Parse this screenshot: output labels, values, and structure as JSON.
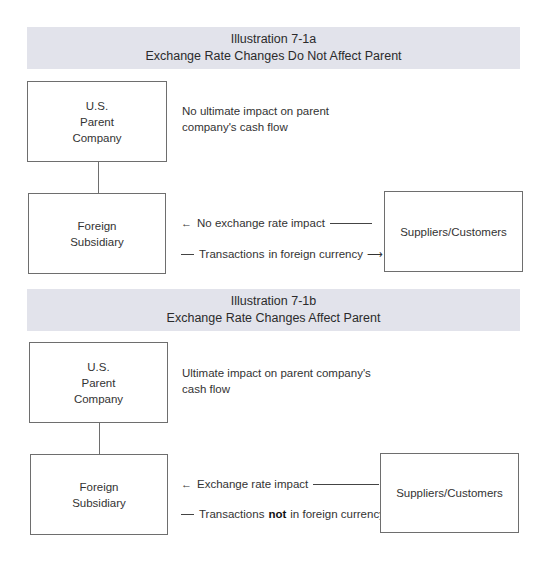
{
  "panels": [
    {
      "header": {
        "title": "Illustration 7-1a",
        "subtitle": "Exchange Rate Changes Do Not Affect Parent"
      },
      "parent_box": {
        "line1": "U.S.",
        "line2": "Parent",
        "line3": "Company"
      },
      "parent_note": {
        "line1": "No ultimate impact on parent",
        "line2": "company's cash flow"
      },
      "subsidiary_box": {
        "line1": "Foreign",
        "line2": "Subsidiary"
      },
      "counterparty_box": {
        "label": "Suppliers/Customers"
      },
      "flows": {
        "inbound": {
          "arrow": "←",
          "label": "No exchange rate impact"
        },
        "outbound": {
          "prefix": "Transactions",
          "emphasis": "",
          "suffix": "in foreign currency",
          "arrow": "⟶"
        }
      }
    },
    {
      "header": {
        "title": "Illustration 7-1b",
        "subtitle": "Exchange Rate Changes Affect Parent"
      },
      "parent_box": {
        "line1": "U.S.",
        "line2": "Parent",
        "line3": "Company"
      },
      "parent_note": {
        "line1": "Ultimate impact on parent company's",
        "line2": "cash flow"
      },
      "subsidiary_box": {
        "line1": "Foreign",
        "line2": "Subsidiary"
      },
      "counterparty_box": {
        "label": "Suppliers/Customers"
      },
      "flows": {
        "inbound": {
          "arrow": "←",
          "label": "Exchange rate impact"
        },
        "outbound": {
          "prefix": "Transactions",
          "emphasis": "not",
          "suffix": "in foreign currency",
          "arrow": "→"
        }
      }
    }
  ],
  "colors": {
    "header_band": "#e2e3eb",
    "box_border": "#6e6e6e",
    "text": "#333333"
  }
}
